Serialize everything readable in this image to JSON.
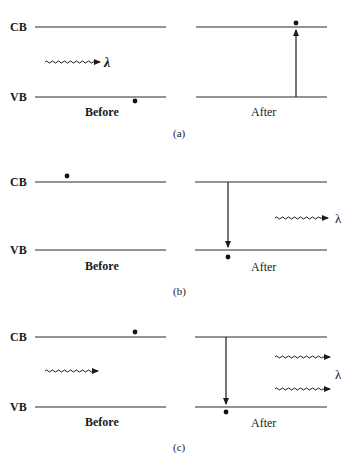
{
  "figure": {
    "panels": [
      {
        "id": "a",
        "label": "(a)",
        "description": "Absorption",
        "before": {
          "caption": "Before",
          "cb_label": "CB",
          "vb_label": "VB",
          "electron": "valence band",
          "photon": {
            "direction": "incoming",
            "label": "λ"
          }
        },
        "after": {
          "caption": "After",
          "transition": "upward (VB to CB)",
          "electron": "conduction band"
        }
      },
      {
        "id": "b",
        "label": "(b)",
        "description": "Spontaneous emission",
        "before": {
          "caption": "Before",
          "cb_label": "CB",
          "vb_label": "VB",
          "electron": "conduction band"
        },
        "after": {
          "caption": "After",
          "transition": "downward (CB to VB)",
          "electron": "valence band",
          "photon": {
            "direction": "outgoing",
            "label": "λ"
          }
        }
      },
      {
        "id": "c",
        "label": "(c)",
        "description": "Stimulated emission",
        "before": {
          "caption": "Before",
          "cb_label": "CB",
          "vb_label": "VB",
          "electron": "conduction band",
          "photon": {
            "direction": "incoming"
          }
        },
        "after": {
          "caption": "After",
          "transition": "downward (CB to VB)",
          "electron": "valence band",
          "photons": {
            "count": 2,
            "direction": "outgoing",
            "label": "λ"
          }
        }
      }
    ]
  },
  "labels": {
    "cb": "CB",
    "vb": "VB",
    "before": "Before",
    "after": "After",
    "lambda": "λ",
    "panel_a": "(a)",
    "panel_b": "(b)",
    "panel_c": "(c)"
  },
  "colors": {
    "line": "#2a2a2a",
    "text": "#1a1a1a",
    "background": "#ffffff"
  }
}
